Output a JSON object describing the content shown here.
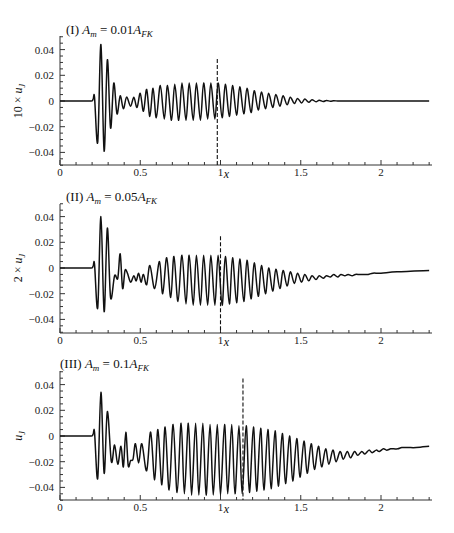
{
  "chart_data": [
    {
      "type": "line",
      "panel": "I",
      "title": "(I) A_m = 0.01A_FK",
      "title_parts": {
        "prefix": "(I) ",
        "var": "A",
        "var_sub": "m",
        "eq": " = 0.01",
        "rhs": "A",
        "rhs_sub": "FK"
      },
      "xlabel": "x",
      "ylabel": "10 × u_J",
      "ylabel_parts": {
        "prefix": "10 × ",
        "var": "u",
        "sub": "J"
      },
      "xlim": [
        0,
        2.3
      ],
      "ylim": [
        -0.05,
        0.05
      ],
      "xticks": [
        0,
        0.5,
        1,
        1.5,
        2
      ],
      "xtick_labels": [
        "0",
        "0.5",
        "1",
        "1.5",
        "2"
      ],
      "yticks": [
        0.04,
        0.02,
        0,
        -0.02,
        -0.04
      ],
      "ytick_labels": [
        "0.04",
        "0.02",
        "0",
        "-0.02",
        "-0.04"
      ],
      "grid": false,
      "dashed_marker_x": 0.98,
      "dashed_marker_top": 0.028,
      "series": [
        {
          "name": "10 × u_J",
          "x": [
            0,
            0.18,
            0.205,
            0.215,
            0.235,
            0.255,
            0.275,
            0.295,
            0.315,
            0.335,
            0.355,
            0.375,
            0.395,
            0.415,
            0.44,
            0.46,
            0.48,
            0.5,
            0.52,
            0.54,
            0.56,
            0.58,
            0.6,
            0.625,
            0.65,
            0.67,
            0.695,
            0.715,
            0.74,
            0.76,
            0.785,
            0.805,
            0.83,
            0.85,
            0.875,
            0.895,
            0.92,
            0.94,
            0.965,
            0.985,
            1.01,
            1.03,
            1.055,
            1.075,
            1.1,
            1.12,
            1.145,
            1.165,
            1.19,
            1.21,
            1.235,
            1.255,
            1.28,
            1.3,
            1.325,
            1.345,
            1.37,
            1.39,
            1.415,
            1.435,
            1.46,
            1.48,
            1.505,
            1.525,
            1.55,
            1.57,
            1.595,
            1.615,
            1.64,
            1.66,
            1.685,
            1.705,
            1.73,
            1.75,
            1.775,
            1.795,
            1.82,
            1.84,
            1.865,
            1.89,
            1.92,
            1.95,
            2.0,
            2.1,
            2.3
          ],
          "y": [
            0,
            0,
            0.001,
            0.003,
            -0.032,
            0.044,
            -0.039,
            0.032,
            -0.021,
            0.014,
            -0.01,
            0.004,
            -0.006,
            0.003,
            -0.004,
            0.003,
            -0.005,
            0.006,
            -0.008,
            0.009,
            -0.012,
            0.01,
            -0.013,
            0.012,
            -0.014,
            0.012,
            -0.015,
            0.013,
            -0.015,
            0.014,
            -0.015,
            0.014,
            -0.015,
            0.014,
            -0.015,
            0.014,
            -0.014,
            0.014,
            -0.014,
            0.014,
            -0.013,
            0.013,
            -0.012,
            0.012,
            -0.011,
            0.011,
            -0.01,
            0.01,
            -0.009,
            0.008,
            -0.007,
            0.007,
            -0.006,
            0.006,
            -0.005,
            0.005,
            -0.004,
            0.004,
            -0.003,
            0.003,
            -0.002,
            0.002,
            -0.0015,
            0.0015,
            -0.001,
            0.001,
            -0.0006,
            0.0006,
            -0.0004,
            0.0004,
            -0.0002,
            0.0002,
            0,
            0,
            0,
            0,
            0,
            0,
            0,
            0,
            0,
            0,
            0,
            0,
            0
          ]
        }
      ]
    },
    {
      "type": "line",
      "panel": "II",
      "title": "(II) A_m = 0.05A_FK",
      "title_parts": {
        "prefix": "(II) ",
        "var": "A",
        "var_sub": "m",
        "eq": " = 0.05",
        "rhs": "A",
        "rhs_sub": "FK"
      },
      "xlabel": "x",
      "ylabel": "2 × u_J",
      "ylabel_parts": {
        "prefix": "2 × ",
        "var": "u",
        "sub": "J"
      },
      "xlim": [
        0,
        2.3
      ],
      "ylim": [
        -0.05,
        0.05
      ],
      "xticks": [
        0,
        0.5,
        1,
        1.5,
        2
      ],
      "xtick_labels": [
        "0",
        "0.5",
        "1",
        "1.5",
        "2"
      ],
      "yticks": [
        0.04,
        0.02,
        0,
        -0.02,
        -0.04
      ],
      "ytick_labels": [
        "0.04",
        "0.02",
        "0",
        "-0.02",
        "-0.04"
      ],
      "grid": false,
      "dashed_marker_x": 1.0,
      "dashed_marker_top": 0.02,
      "series": [
        {
          "name": "2 × u_J",
          "x": [
            0,
            0.18,
            0.205,
            0.215,
            0.235,
            0.255,
            0.275,
            0.295,
            0.315,
            0.34,
            0.36,
            0.375,
            0.39,
            0.405,
            0.42,
            0.44,
            0.46,
            0.475,
            0.49,
            0.505,
            0.52,
            0.54,
            0.56,
            0.59,
            0.62,
            0.64,
            0.665,
            0.69,
            0.71,
            0.735,
            0.76,
            0.785,
            0.805,
            0.83,
            0.85,
            0.875,
            0.895,
            0.92,
            0.94,
            0.965,
            0.985,
            1.01,
            1.03,
            1.055,
            1.075,
            1.1,
            1.12,
            1.145,
            1.165,
            1.19,
            1.21,
            1.235,
            1.255,
            1.28,
            1.3,
            1.325,
            1.345,
            1.37,
            1.39,
            1.415,
            1.435,
            1.46,
            1.48,
            1.505,
            1.525,
            1.55,
            1.57,
            1.595,
            1.615,
            1.64,
            1.66,
            1.685,
            1.705,
            1.73,
            1.75,
            1.775,
            1.795,
            1.82,
            1.84,
            1.865,
            1.89,
            1.92,
            1.95,
            2.0,
            2.1,
            2.3
          ],
          "y": [
            0,
            0,
            0.001,
            0.003,
            -0.031,
            0.04,
            -0.034,
            0.031,
            -0.023,
            -0.006,
            -0.008,
            0.011,
            -0.016,
            -0.002,
            -0.004,
            -0.011,
            -0.006,
            -0.01,
            -0.004,
            -0.011,
            -0.005,
            -0.013,
            0.002,
            -0.016,
            0.005,
            -0.02,
            0.008,
            -0.023,
            0.009,
            -0.026,
            0.01,
            -0.028,
            0.01,
            -0.029,
            0.01,
            -0.029,
            0.01,
            -0.029,
            0.01,
            -0.029,
            0.01,
            -0.029,
            0.009,
            -0.028,
            0.008,
            -0.027,
            0.007,
            -0.026,
            0.006,
            -0.024,
            0.004,
            -0.022,
            0.002,
            -0.02,
            0.0,
            -0.018,
            -0.001,
            -0.016,
            -0.002,
            -0.014,
            -0.003,
            -0.012,
            -0.004,
            -0.011,
            -0.005,
            -0.01,
            -0.006,
            -0.009,
            -0.006,
            -0.008,
            -0.006,
            -0.007,
            -0.005,
            -0.007,
            -0.005,
            -0.006,
            -0.005,
            -0.006,
            -0.005,
            -0.005,
            -0.005,
            -0.005,
            -0.004,
            -0.004,
            -0.003,
            -0.002
          ]
        }
      ]
    },
    {
      "type": "line",
      "panel": "III",
      "title": "(III) A_m = 0.1A_FK",
      "title_parts": {
        "prefix": "(III) ",
        "var": "A",
        "var_sub": "m",
        "eq": " = 0.1",
        "rhs": "A",
        "rhs_sub": "FK"
      },
      "xlabel": "x",
      "ylabel": "u_J",
      "ylabel_parts": {
        "prefix": "",
        "var": "u",
        "sub": "J"
      },
      "xlim": [
        0,
        2.3
      ],
      "ylim": [
        -0.05,
        0.05
      ],
      "xticks": [
        0,
        0.5,
        1,
        1.5,
        2
      ],
      "xtick_labels": [
        "0",
        "0.5",
        "1",
        "1.5",
        "2"
      ],
      "yticks": [
        0.04,
        0.02,
        0,
        -0.02,
        -0.04
      ],
      "ytick_labels": [
        "0.04",
        "0.02",
        "0",
        "-0.02",
        "-0.04"
      ],
      "grid": false,
      "dashed_marker_x": 1.14,
      "dashed_marker_top": 0.04,
      "series": [
        {
          "name": "u_J",
          "x": [
            0,
            0.18,
            0.205,
            0.215,
            0.235,
            0.255,
            0.275,
            0.295,
            0.32,
            0.34,
            0.36,
            0.38,
            0.395,
            0.41,
            0.425,
            0.44,
            0.455,
            0.47,
            0.49,
            0.51,
            0.54,
            0.565,
            0.59,
            0.61,
            0.635,
            0.655,
            0.68,
            0.705,
            0.73,
            0.755,
            0.775,
            0.8,
            0.82,
            0.845,
            0.865,
            0.89,
            0.91,
            0.935,
            0.955,
            0.98,
            1.0,
            1.025,
            1.045,
            1.07,
            1.09,
            1.115,
            1.135,
            1.16,
            1.18,
            1.205,
            1.225,
            1.25,
            1.27,
            1.295,
            1.315,
            1.34,
            1.36,
            1.385,
            1.405,
            1.43,
            1.45,
            1.475,
            1.495,
            1.52,
            1.54,
            1.565,
            1.585,
            1.61,
            1.63,
            1.655,
            1.675,
            1.7,
            1.72,
            1.745,
            1.765,
            1.79,
            1.81,
            1.835,
            1.855,
            1.88,
            1.9,
            1.925,
            1.945,
            1.97,
            1.99,
            2.015,
            2.035,
            2.06,
            2.08,
            2.105,
            2.13,
            2.17,
            2.22,
            2.3
          ],
          "y": [
            0,
            0,
            0.001,
            0.003,
            -0.033,
            0.034,
            -0.029,
            0.019,
            -0.02,
            -0.007,
            -0.022,
            -0.008,
            -0.024,
            0.003,
            -0.023,
            -0.019,
            -0.018,
            -0.006,
            -0.021,
            -0.006,
            -0.027,
            0.003,
            -0.034,
            0.005,
            -0.038,
            0.007,
            -0.042,
            0.009,
            -0.044,
            0.01,
            -0.045,
            0.01,
            -0.046,
            0.01,
            -0.046,
            0.01,
            -0.046,
            0.009,
            -0.046,
            0.009,
            -0.046,
            0.009,
            -0.045,
            0.009,
            -0.045,
            0.008,
            -0.045,
            0.008,
            -0.044,
            0.007,
            -0.043,
            0.006,
            -0.042,
            0.005,
            -0.041,
            0.004,
            -0.039,
            0.002,
            -0.037,
            0.0,
            -0.035,
            -0.002,
            -0.032,
            -0.004,
            -0.029,
            -0.006,
            -0.026,
            -0.008,
            -0.024,
            -0.01,
            -0.022,
            -0.011,
            -0.02,
            -0.012,
            -0.018,
            -0.012,
            -0.017,
            -0.012,
            -0.015,
            -0.012,
            -0.014,
            -0.011,
            -0.013,
            -0.011,
            -0.012,
            -0.01,
            -0.011,
            -0.01,
            -0.01,
            -0.01,
            -0.009,
            -0.009,
            -0.009,
            -0.008
          ]
        }
      ]
    }
  ],
  "layout": {
    "panels": [
      {
        "axis_left": 60,
        "axis_right": 432,
        "plot_top": 36,
        "axis_bottom": 165,
        "y_zero": 101,
        "y_per_unit": 1285,
        "title_x": 66,
        "title_y": 34,
        "xlabel_y": 178,
        "ylabel_x": 22,
        "ylabel_y": 101
      },
      {
        "axis_left": 60,
        "axis_right": 432,
        "plot_top": 204,
        "axis_bottom": 333,
        "y_zero": 268,
        "y_per_unit": 1285,
        "title_x": 66,
        "title_y": 201,
        "xlabel_y": 346,
        "ylabel_x": 22,
        "ylabel_y": 268
      },
      {
        "axis_left": 60,
        "axis_right": 432,
        "plot_top": 371,
        "axis_bottom": 500,
        "y_zero": 436,
        "y_per_unit": 1285,
        "title_x": 60,
        "title_y": 368,
        "xlabel_y": 513,
        "ylabel_x": 22,
        "ylabel_y": 436
      }
    ],
    "x_px_per_unit": 160.5
  }
}
